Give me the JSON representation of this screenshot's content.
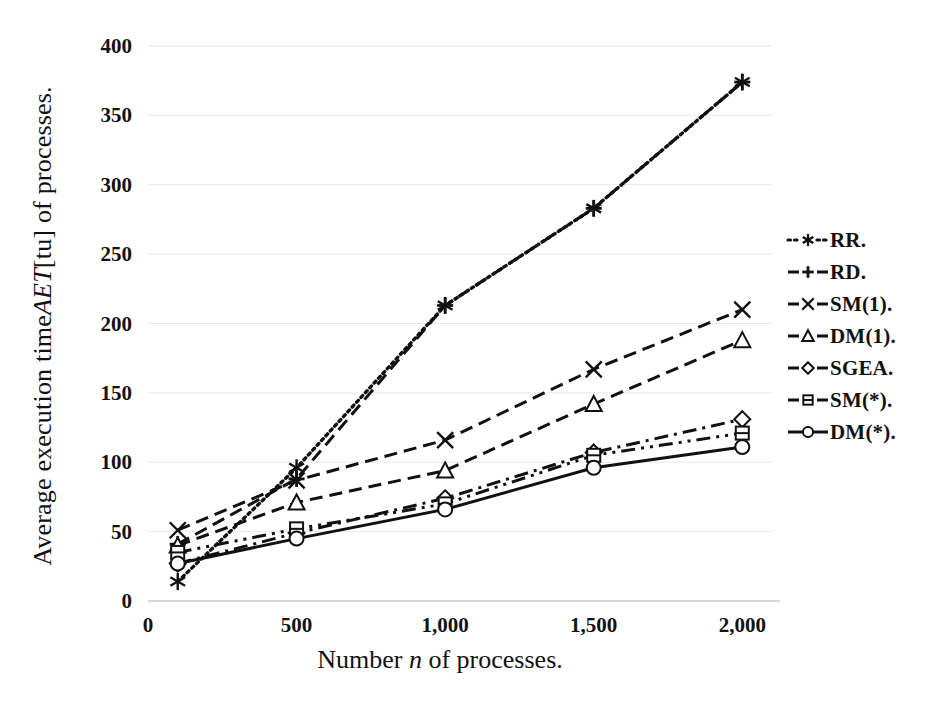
{
  "chart_data": {
    "type": "line",
    "title": "",
    "xlabel": "Number n of processes.",
    "ylabel": "Average execution time AET [tu] of processes.",
    "xlim": [
      0,
      2100
    ],
    "ylim": [
      0,
      400
    ],
    "x": [
      100,
      500,
      1000,
      1500,
      2000
    ],
    "xticks": [
      "0",
      "500",
      "1,000",
      "1,500",
      "2,000"
    ],
    "xtickvalues": [
      0,
      500,
      1000,
      1500,
      2000
    ],
    "yticks": [
      "0",
      "50",
      "100",
      "150",
      "200",
      "250",
      "300",
      "350",
      "400"
    ],
    "ytickvalues": [
      0,
      50,
      100,
      150,
      200,
      250,
      300,
      350,
      400
    ],
    "grid": false,
    "legend_position": "right",
    "series": [
      {
        "name": "RR.",
        "label": "RR.",
        "marker": "asterisk",
        "dash": "dotted",
        "values": [
          14,
          96,
          213,
          283,
          374
        ]
      },
      {
        "name": "RD.",
        "label": "RD.",
        "marker": "plus",
        "dash": "dashed",
        "values": [
          41,
          88,
          213,
          283,
          374
        ]
      },
      {
        "name": "SM(1).",
        "label": "SM(1).",
        "marker": "cross",
        "dash": "dashed",
        "values": [
          51,
          87,
          116,
          167,
          210
        ]
      },
      {
        "name": "DM(1).",
        "label": "DM(1).",
        "marker": "triangle",
        "dash": "dashed",
        "values": [
          40,
          71,
          94,
          142,
          188
        ]
      },
      {
        "name": "SGEA.",
        "label": "SGEA.",
        "marker": "diamond",
        "dash": "dashdot",
        "values": [
          27,
          49,
          74,
          107,
          131
        ]
      },
      {
        "name": "SM(*).",
        "label": "SM(*).",
        "marker": "square",
        "dash": "dashdotdot",
        "values": [
          35,
          52,
          70,
          105,
          121
        ]
      },
      {
        "name": "DM(*).",
        "label": "DM(*).",
        "marker": "circle",
        "dash": "solid",
        "values": [
          27,
          45,
          66,
          96,
          111
        ]
      }
    ]
  },
  "axis": {
    "y_title": "Average execution time ",
    "y_title_em": "AET",
    "y_title_rest": " [tu] of processes.",
    "x_title": "Number ",
    "x_title_em": "n",
    "x_title_rest": " of processes."
  },
  "colors": {
    "ink": "#111111",
    "background": "#ffffff"
  }
}
